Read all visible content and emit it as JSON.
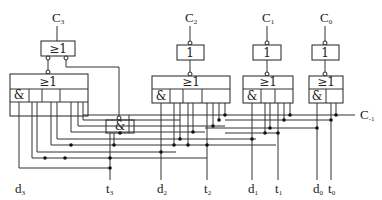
{
  "diagram": {
    "type": "logic-circuit",
    "outputs": [
      "C3",
      "C2",
      "C1",
      "C0"
    ],
    "output_labels": {
      "c3": {
        "main": "C",
        "sub": "3"
      },
      "c2": {
        "main": "C",
        "sub": "2"
      },
      "c1": {
        "main": "C",
        "sub": "1"
      },
      "c0": {
        "main": "C",
        "sub": "0"
      }
    },
    "carry_in": {
      "main": "C",
      "sub": "-1"
    },
    "inputs": {
      "d3": {
        "main": "d",
        "sub": "3"
      },
      "t3": {
        "main": "t",
        "sub": "3"
      },
      "d2": {
        "main": "d",
        "sub": "2"
      },
      "t2": {
        "main": "t",
        "sub": "2"
      },
      "d1": {
        "main": "d",
        "sub": "1"
      },
      "t1": {
        "main": "t",
        "sub": "1"
      },
      "d0": {
        "main": "d",
        "sub": "0"
      },
      "t0": {
        "main": "t",
        "sub": "0"
      }
    },
    "gate_symbols": {
      "or": "≥1",
      "not": "1",
      "and": "&"
    }
  }
}
